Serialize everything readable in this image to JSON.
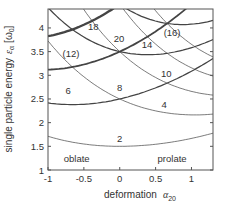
{
  "chart_data": {
    "type": "line",
    "title": "",
    "xlabel": "deformation",
    "xlabel_symbol": "α",
    "xlabel_sub": "20",
    "ylabel": "single particle energy",
    "ylabel_symbol": "ε",
    "ylabel_sub": "α",
    "ylabel_unit": "[ω",
    "ylabel_unit_sub": "0",
    "ylabel_unit_end": "]",
    "xlim": [
      -1,
      1.3
    ],
    "ylim": [
      1,
      4.4
    ],
    "x_ticks": [
      -1,
      -0.5,
      0,
      0.5,
      1
    ],
    "x_tick_labels": [
      "-1",
      "-0.5",
      "0",
      "0.5",
      "1"
    ],
    "y_ticks": [
      1,
      1.5,
      2,
      2.5,
      3,
      3.5,
      4
    ],
    "y_tick_labels": [
      "1",
      "1.5",
      "2",
      "2.5",
      "3",
      "3.5",
      "4"
    ],
    "grid": false,
    "model": "eps = exp(k*a)*(n_perp+1) + exp(-2*k*a)*(n_z+0.5), k=0.35",
    "k": 0.35,
    "series": [
      {
        "n_perp": 0,
        "n_z": 0
      },
      {
        "n_perp": 1,
        "n_z": 0
      },
      {
        "n_perp": 0,
        "n_z": 1
      },
      {
        "n_perp": 2,
        "n_z": 0
      },
      {
        "n_perp": 1,
        "n_z": 1
      },
      {
        "n_perp": 0,
        "n_z": 2
      },
      {
        "n_perp": 3,
        "n_z": 0
      },
      {
        "n_perp": 2,
        "n_z": 1
      },
      {
        "n_perp": 1,
        "n_z": 2
      },
      {
        "n_perp": 0,
        "n_z": 3
      },
      {
        "n_perp": 4,
        "n_z": 0
      },
      {
        "n_perp": 3,
        "n_z": 1
      },
      {
        "n_perp": 2,
        "n_z": 2
      },
      {
        "n_perp": 1,
        "n_z": 3
      },
      {
        "n_perp": 0,
        "n_z": 4
      }
    ],
    "annotations": [
      {
        "text": "2",
        "x": 0.0,
        "y": 1.6
      },
      {
        "text": "4",
        "x": 0.62,
        "y": 2.3
      },
      {
        "text": "6",
        "x": -0.72,
        "y": 2.6
      },
      {
        "text": "8",
        "x": 0.0,
        "y": 2.66
      },
      {
        "text": "10",
        "x": 0.65,
        "y": 2.97
      },
      {
        "text": "(12)",
        "x": -0.68,
        "y": 3.38
      },
      {
        "text": "14",
        "x": 0.38,
        "y": 3.57
      },
      {
        "text": "(16)",
        "x": 0.73,
        "y": 3.83
      },
      {
        "text": "18",
        "x": -0.37,
        "y": 3.96
      },
      {
        "text": "20",
        "x": -0.01,
        "y": 3.7
      },
      {
        "text": "oblate",
        "x": -0.6,
        "y": 1.16
      },
      {
        "text": "prolate",
        "x": 0.73,
        "y": 1.16
      }
    ]
  }
}
